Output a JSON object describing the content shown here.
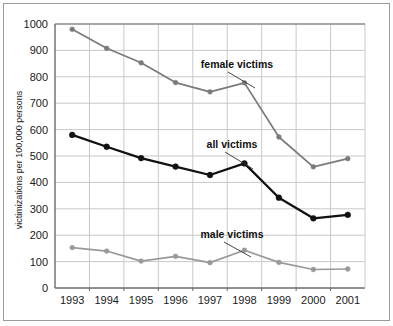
{
  "chart_data": {
    "type": "line",
    "title": "",
    "xlabel": "",
    "ylabel": "victimizations per 100,000 persons",
    "categories": [
      "1993",
      "1994",
      "1995",
      "1996",
      "1997",
      "1998",
      "1999",
      "2000",
      "2001"
    ],
    "x": [
      1993,
      1994,
      1995,
      1996,
      1997,
      1998,
      1999,
      2000,
      2001
    ],
    "ylim": [
      0,
      1000
    ],
    "yticks": [
      0,
      100,
      200,
      300,
      400,
      500,
      600,
      700,
      800,
      900,
      1000
    ],
    "ytick_labels": [
      "0",
      "100",
      "200",
      "300",
      "400",
      "500",
      "600",
      "700",
      "800",
      "900",
      "1000"
    ],
    "grid": true,
    "legend_position": "inline-annotations",
    "series": [
      {
        "name": "female victims",
        "color": "#7a7a7a",
        "values": [
          980,
          908,
          853,
          778,
          743,
          777,
          572,
          459,
          490
        ]
      },
      {
        "name": "all victims",
        "color": "#111111",
        "values": [
          580,
          535,
          492,
          460,
          428,
          472,
          342,
          264,
          277
        ]
      },
      {
        "name": "male victims",
        "color": "#999999",
        "values": [
          153,
          140,
          102,
          120,
          96,
          143,
          97,
          70,
          72
        ]
      }
    ],
    "annotations": [
      {
        "text": "female victims",
        "series": "female victims",
        "anchor_year": 1998
      },
      {
        "text": "all victims",
        "series": "all victims",
        "anchor_year": 1998
      },
      {
        "text": "male victims",
        "series": "male victims",
        "anchor_year": 1998
      }
    ]
  },
  "colors": {
    "female_series": "#7a7a7a",
    "all_series": "#111111",
    "male_series": "#999999",
    "grid": "#c9c9c9",
    "axis": "#6b6b6b",
    "frame": "#9a9a9a",
    "background": "#ffffff",
    "text": "#1a1a1a"
  }
}
